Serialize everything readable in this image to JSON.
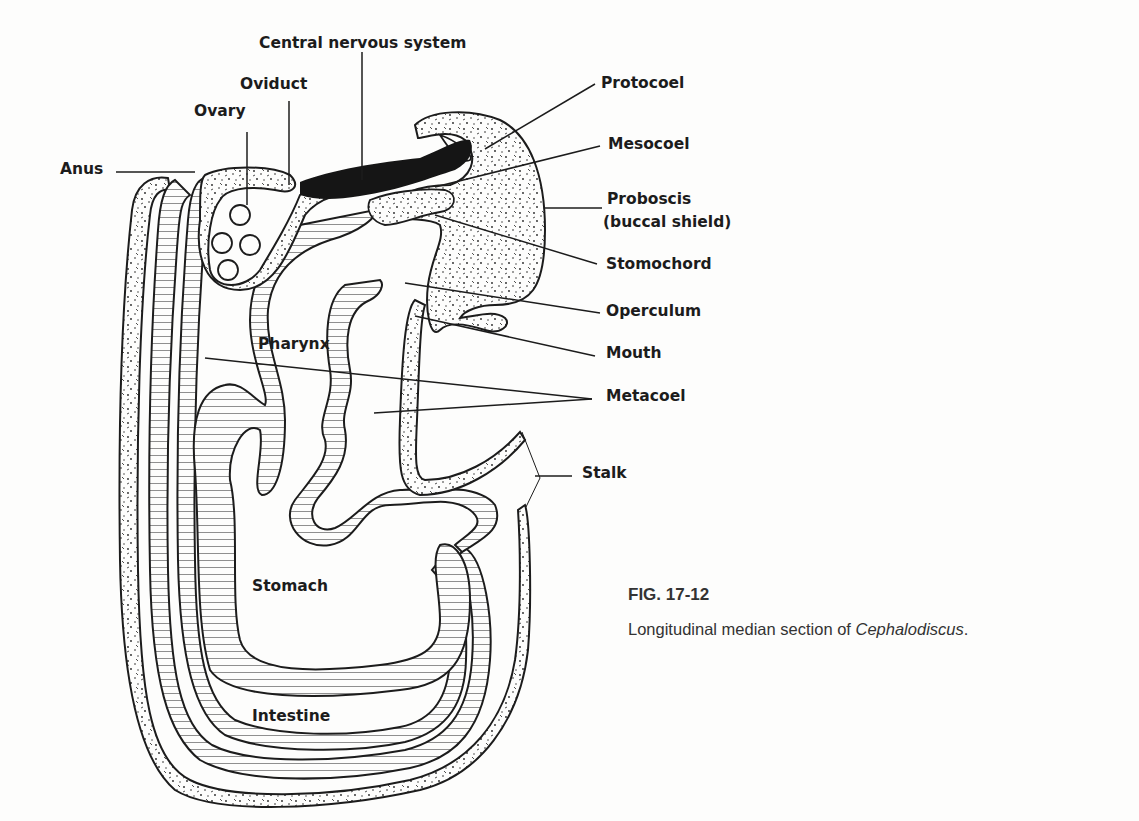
{
  "figure": {
    "number": "FIG. 17-12",
    "caption_prefix": "Longitudinal median section of ",
    "caption_genus": "Cephalodiscus",
    "caption_suffix": "."
  },
  "labels": {
    "central_nervous_system": "Central nervous system",
    "oviduct": "Oviduct",
    "ovary": "Ovary",
    "anus": "Anus",
    "protocoel": "Protocoel",
    "mesocoel": "Mesocoel",
    "proboscis": "Proboscis",
    "proboscis_sub": "(buccal shield)",
    "stomochord": "Stomochord",
    "operculum": "Operculum",
    "mouth": "Mouth",
    "pharynx": "Pharynx",
    "metacoel": "Metacoel",
    "stalk": "Stalk",
    "stomach": "Stomach",
    "intestine": "Intestine"
  },
  "colors": {
    "ink": "#1c1c1c",
    "paper": "#fdfdfc",
    "caption": "#333333"
  }
}
